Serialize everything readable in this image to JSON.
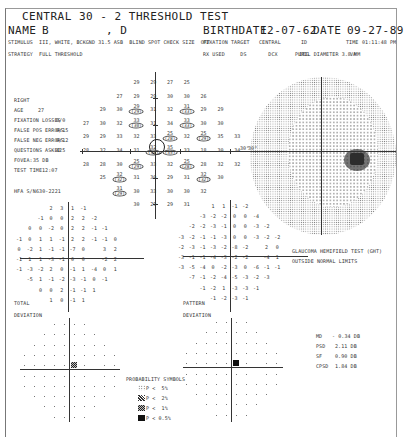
{
  "header": {
    "title": "CENTRAL 30 - 2 THRESHOLD TEST",
    "name_label": "NAME",
    "name_value": "B        , D",
    "birthdate_label": "BIRTHDATE",
    "birthdate_value": "12-07-62",
    "date_label": "DATE",
    "date_value": "09-27-89",
    "stimulus_line": "STIMULUS  III, WHITE, BCKGND 31.5 ASB  BLIND SPOT CHECK SIZE  OFF",
    "strategy_line": "STRATEGY  FULL THRESHOLD",
    "fixation_line": "FIXATION TARGET   CENTRAL",
    "id_label": "ID",
    "time_label": "TIME",
    "time_value": "01:11:48 PM",
    "rx_line": "RX USED     DS       DCX       DEG",
    "pupil_line": "PUPIL DIAMETER 3.8 MM",
    "va_label": "VA"
  },
  "patient_info": {
    "eye": "RIGHT",
    "age_label": "AGE",
    "age_value": "27",
    "fixation_losses_label": "FIXATION LOSSES",
    "fixation_losses_value": "0/0",
    "false_pos_label": "FALSE POS ERRORS",
    "false_pos_value": "0/15",
    "false_neg_label": "FALSE NEG ERRORS",
    "false_neg_value": "0/12",
    "questions_label": "QUESTIONS ASKED",
    "questions_value": "425",
    "fovea_label": "FOVEA:",
    "fovea_value": "35 DB",
    "test_time_label": "TEST TIME",
    "test_time_value": "12:07",
    "hfa_label": "HFA S/N",
    "hfa_value": "630-2221"
  },
  "threshold_grid": {
    "rows": [
      [
        "",
        "",
        "",
        "29",
        "29",
        "27",
        "25",
        "",
        "",
        ""
      ],
      [
        "",
        "",
        "27",
        "29",
        "29",
        "30",
        "30",
        "26",
        "",
        ""
      ],
      [
        "",
        "29",
        "30",
        "29",
        "31",
        "32",
        "31",
        "29",
        "29",
        ""
      ],
      [
        "27",
        "30",
        "32",
        "33",
        "31",
        "34",
        "33",
        "30",
        "30",
        ""
      ],
      [
        "29",
        "29",
        "33",
        "32",
        "33",
        "25",
        "32",
        "25",
        "35",
        "33"
      ],
      [
        "28",
        "32",
        "34",
        "31",
        "32",
        "35",
        "33",
        "18",
        "30",
        "34"
      ],
      [
        "28",
        "28",
        "30",
        "25",
        "33",
        "32",
        "25",
        "28",
        "32",
        "32"
      ],
      [
        "",
        "25",
        "32",
        "31",
        "30",
        "29",
        "31",
        "32",
        "30",
        ""
      ],
      [
        "",
        "",
        "31",
        "30",
        "33",
        "30",
        "30",
        "32",
        "",
        ""
      ],
      [
        "",
        "",
        "",
        "30",
        "29",
        "29",
        "31",
        "",
        "",
        ""
      ]
    ],
    "retest": [
      {
        "row": 2,
        "col": 3,
        "value": "(29)"
      },
      {
        "row": 2,
        "col": 6,
        "value": "(33)"
      },
      {
        "row": 3,
        "col": 3,
        "value": "(30)"
      },
      {
        "row": 3,
        "col": 6,
        "value": "(33)"
      },
      {
        "row": 4,
        "col": 5,
        "value": "(28)"
      },
      {
        "row": 4,
        "col": 7,
        "value": "(29)"
      },
      {
        "row": 5,
        "col": 4,
        "value": "(34)"
      },
      {
        "row": 5,
        "col": 5,
        "value": "(35)"
      },
      {
        "row": 6,
        "col": 3,
        "value": "(29)"
      },
      {
        "row": 6,
        "col": 6,
        "value": "(28)"
      },
      {
        "row": 7,
        "col": 2,
        "value": "(32)"
      },
      {
        "row": 7,
        "col": 7,
        "value": "(32)"
      },
      {
        "row": 8,
        "col": 2,
        "value": "(29)"
      }
    ],
    "axis_label": "30°"
  },
  "total_deviation": {
    "label_1": "TOTAL",
    "label_2": "DEVIATION",
    "rows": [
      [
        "",
        "",
        "",
        "2",
        "3",
        "1",
        "-1",
        "",
        "",
        ""
      ],
      [
        "",
        "",
        "-1",
        "0",
        "0",
        "2",
        "2",
        "-2",
        "",
        ""
      ],
      [
        "",
        "0",
        "0",
        "-2",
        "0",
        "2",
        "2",
        "-1",
        "-1",
        ""
      ],
      [
        "-1",
        "0",
        "1",
        "1",
        "-1",
        "2",
        "2",
        "-1",
        "-1",
        "0"
      ],
      [
        "0",
        "-2",
        "1",
        "-1",
        "-1",
        "-7",
        "0",
        "",
        "3",
        "2"
      ],
      [
        "-1",
        "1",
        "1",
        "-3",
        "-1",
        "0",
        "0",
        "",
        "-2",
        "2"
      ],
      [
        "-1",
        "-3",
        "-2",
        "2",
        "0",
        "-1",
        "1",
        "-4",
        "0",
        "1"
      ],
      [
        "",
        "-5",
        "1",
        "-1",
        "-2",
        "-3",
        "-1",
        "0",
        "-1",
        ""
      ],
      [
        "",
        "",
        "0",
        "0",
        "2",
        "-1",
        "-1",
        "1",
        "",
        ""
      ],
      [
        "",
        "",
        "",
        "1",
        "0",
        "-1",
        "1",
        "",
        "",
        ""
      ]
    ]
  },
  "pattern_deviation": {
    "label_1": "PATTERN",
    "label_2": "DEVIATION",
    "rows": [
      [
        "",
        "",
        "",
        "1",
        "1",
        "-1",
        "-2",
        "",
        "",
        ""
      ],
      [
        "",
        "",
        "-3",
        "-2",
        "-2",
        "0",
        "0",
        "-4",
        "",
        ""
      ],
      [
        "",
        "-2",
        "-2",
        "-3",
        "-1",
        "0",
        "0",
        "-3",
        "-2",
        ""
      ],
      [
        "-3",
        "-2",
        "-1",
        "-1",
        "-3",
        "0",
        "0",
        "-3",
        "-2",
        "-2"
      ],
      [
        "-2",
        "-3",
        "-1",
        "-3",
        "-2",
        "-8",
        "-2",
        "",
        "2",
        "0"
      ],
      [
        "-3",
        "-1",
        "-1",
        "-4",
        "-3",
        "-2",
        "-2",
        "",
        "-4",
        "1"
      ],
      [
        "-3",
        "-5",
        "-4",
        "0",
        "-2",
        "-3",
        "0",
        "-6",
        "-1",
        "-1"
      ],
      [
        "",
        "-7",
        "-1",
        "-2",
        "-4",
        "-5",
        "-3",
        "-2",
        "-3",
        ""
      ],
      [
        "",
        "",
        "-1",
        "-2",
        "1",
        "-3",
        "-3",
        "-1",
        "",
        ""
      ],
      [
        "",
        "",
        "",
        "-1",
        "-2",
        "-3",
        "-1",
        "",
        "",
        ""
      ]
    ]
  },
  "ght": {
    "line1": "GLAUCOMA HEMIFIELD TEST (GHT)",
    "line2": "OUTSIDE NORMAL LIMITS"
  },
  "global_indices": [
    {
      "label": "MD",
      "value": "- 0.34 DB"
    },
    {
      "label": "PSD",
      "value": "2.11 DB"
    },
    {
      "label": "SF",
      "value": "0.90 DB"
    },
    {
      "label": "CPSD",
      "value": "1.84 DB"
    }
  ],
  "probability_symbols": {
    "title": "PROBABILITY SYMBOLS",
    "items": [
      {
        "icon": "sparse-dots-icon",
        "text": "P <  5%"
      },
      {
        "icon": "hatched-icon",
        "text": "P <  2%"
      },
      {
        "icon": "dense-checker-icon",
        "text": "P <  1%"
      },
      {
        "icon": "solid-square-icon",
        "text": "P < 0.5%"
      }
    ]
  },
  "prob_plots": {
    "total": {
      "marks": [
        {
          "row": 4,
          "col": 5,
          "sym": "p1"
        }
      ]
    },
    "pattern": {
      "marks": [
        {
          "row": 4,
          "col": 5,
          "sym": "p05"
        },
        {
          "row": 5,
          "col": 7,
          "sym": "p5"
        }
      ]
    }
  },
  "colors": {
    "ink": "#222222",
    "paper": "#ffffff",
    "frame": "#777777"
  }
}
